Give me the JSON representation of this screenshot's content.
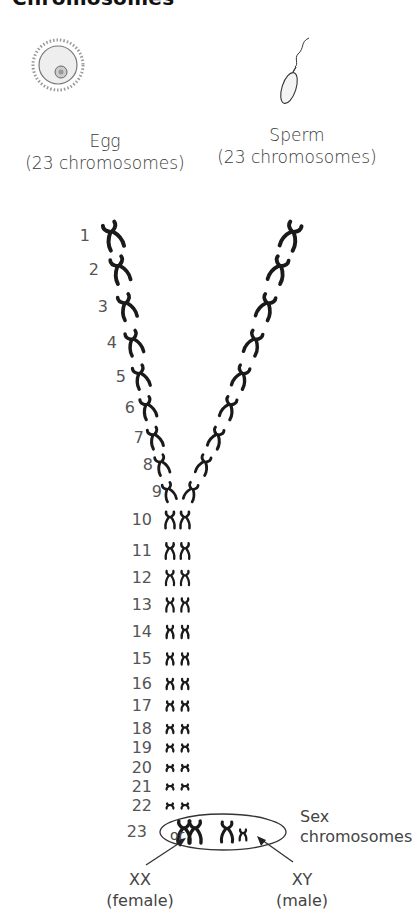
{
  "title": "Chromosomes",
  "egg": {
    "label": "Egg",
    "sublabel": "(23 chromosomes)"
  },
  "sperm": {
    "label": "Sperm",
    "sublabel": "(23 chromosomes)"
  },
  "pairs": [
    {
      "n": "1",
      "y": 236
    },
    {
      "n": "2",
      "y": 270
    },
    {
      "n": "3",
      "y": 307
    },
    {
      "n": "4",
      "y": 343
    },
    {
      "n": "5",
      "y": 377
    },
    {
      "n": "6",
      "y": 408
    },
    {
      "n": "7",
      "y": 438
    },
    {
      "n": "8",
      "y": 465
    },
    {
      "n": "9",
      "y": 492
    },
    {
      "n": "10",
      "y": 520
    },
    {
      "n": "11",
      "y": 551
    },
    {
      "n": "12",
      "y": 578
    },
    {
      "n": "13",
      "y": 605
    },
    {
      "n": "14",
      "y": 632
    },
    {
      "n": "15",
      "y": 659
    },
    {
      "n": "16",
      "y": 684
    },
    {
      "n": "17",
      "y": 706
    },
    {
      "n": "18",
      "y": 729
    },
    {
      "n": "19",
      "y": 748
    },
    {
      "n": "20",
      "y": 768
    },
    {
      "n": "21",
      "y": 787
    },
    {
      "n": "22",
      "y": 806
    },
    {
      "n": "23",
      "y": 832
    }
  ],
  "sex_group": {
    "or_label": "or",
    "side_label_line1": "Sex",
    "side_label_line2": "chromosomes",
    "female": {
      "label": "XX",
      "sublabel": "(female)"
    },
    "male": {
      "label": "XY",
      "sublabel": "(male)"
    }
  },
  "colors": {
    "chromosome": "#1a1a1a",
    "text": "#444444"
  }
}
